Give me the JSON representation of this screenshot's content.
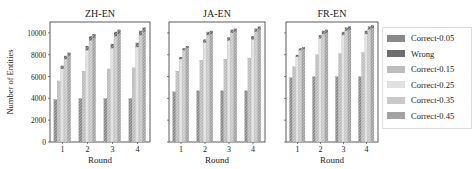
{
  "chart_data": [
    {
      "type": "bar",
      "title": "ZH-EN",
      "xlabel": "Round",
      "ylabel": "Number of Entities",
      "categories": [
        "1",
        "2",
        "3",
        "4"
      ],
      "ylim": [
        0,
        11000
      ],
      "yticks": [
        0,
        2000,
        4000,
        6000,
        8000,
        10000
      ],
      "series": [
        {
          "name": "Correct-0.05",
          "values": [
            3900,
            4000,
            4000,
            4000
          ]
        },
        {
          "name": "Correct-0.15",
          "values": [
            5600,
            6500,
            6700,
            6800
          ]
        },
        {
          "name": "Correct-0.25",
          "values": [
            6700,
            8400,
            8600,
            8700
          ]
        },
        {
          "name": "Correct-0.35",
          "values": [
            7600,
            9300,
            9700,
            9800
          ]
        },
        {
          "name": "Correct-0.45",
          "values": [
            7900,
            9500,
            9900,
            10100
          ]
        },
        {
          "name": "Wrong",
          "stacked_on_top": true,
          "values": [
            300,
            400,
            400,
            400
          ]
        }
      ]
    },
    {
      "type": "bar",
      "title": "JA-EN",
      "xlabel": "Round",
      "ylabel": "",
      "categories": [
        "1",
        "2",
        "3",
        "4"
      ],
      "ylim": [
        0,
        11000
      ],
      "series": [
        {
          "name": "Correct-0.05",
          "values": [
            4600,
            4700,
            4700,
            4700
          ]
        },
        {
          "name": "Correct-0.15",
          "values": [
            6500,
            7500,
            7600,
            7700
          ]
        },
        {
          "name": "Correct-0.25",
          "values": [
            7600,
            9100,
            9300,
            9400
          ]
        },
        {
          "name": "Correct-0.35",
          "values": [
            8400,
            9800,
            10000,
            10100
          ]
        },
        {
          "name": "Correct-0.45",
          "values": [
            8600,
            9900,
            10100,
            10300
          ]
        },
        {
          "name": "Wrong",
          "stacked_on_top": true,
          "values": [
            200,
            300,
            300,
            300
          ]
        }
      ]
    },
    {
      "type": "bar",
      "title": "FR-EN",
      "xlabel": "Round",
      "ylabel": "",
      "categories": [
        "1",
        "2",
        "3",
        "4"
      ],
      "ylim": [
        0,
        11000
      ],
      "series": [
        {
          "name": "Correct-0.05",
          "values": [
            5900,
            6000,
            6000,
            6000
          ]
        },
        {
          "name": "Correct-0.15",
          "values": [
            6900,
            8000,
            8100,
            8200
          ]
        },
        {
          "name": "Correct-0.25",
          "values": [
            7800,
            9500,
            9800,
            9900
          ]
        },
        {
          "name": "Correct-0.35",
          "values": [
            8400,
            9900,
            10200,
            10300
          ]
        },
        {
          "name": "Correct-0.45",
          "values": [
            8500,
            10000,
            10300,
            10400
          ]
        },
        {
          "name": "Wrong",
          "stacked_on_top": true,
          "values": [
            200,
            300,
            300,
            300
          ]
        }
      ]
    }
  ],
  "legend": {
    "items": [
      {
        "label": "Correct-0.05",
        "color": "#8a8a8a"
      },
      {
        "label": "Wrong",
        "color": "#6e6e6e"
      },
      {
        "label": "Correct-0.15",
        "color": "#bdbdbd"
      },
      {
        "label": "Correct-0.25",
        "color": "#e0e0e0"
      },
      {
        "label": "Correct-0.35",
        "color": "#c9c9c9"
      },
      {
        "label": "Correct-0.45",
        "color": "#a3a3a3"
      }
    ]
  },
  "axes": {
    "ylabel": "Number of Entities",
    "xlabel": "Round",
    "yticks": [
      "0",
      "2000",
      "4000",
      "6000",
      "8000",
      "10000"
    ],
    "xticks": [
      "1",
      "2",
      "3",
      "4"
    ]
  }
}
